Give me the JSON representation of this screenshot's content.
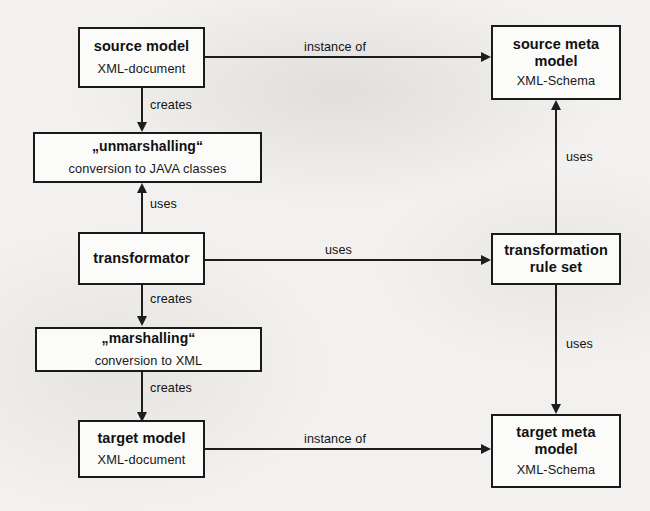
{
  "diagram": {
    "background_color": "#f2f1ef",
    "stroke_color": "#1d1d1d",
    "nodes": [
      {
        "id": "source_model",
        "title": "source model",
        "subtitle": "XML-document"
      },
      {
        "id": "source_meta_model",
        "title": "source meta",
        "title2": "model",
        "subtitle": "XML-Schema"
      },
      {
        "id": "unmarshalling",
        "title": "„unmarshalling“",
        "subtitle": "conversion to JAVA classes"
      },
      {
        "id": "transformator",
        "title": "transformator",
        "subtitle": ""
      },
      {
        "id": "transformation_rules",
        "title": "transformation",
        "title2": "rule set",
        "subtitle": ""
      },
      {
        "id": "marshalling",
        "title": "„marshalling“",
        "subtitle": "conversion to XML"
      },
      {
        "id": "target_model",
        "title": "target model",
        "subtitle": "XML-document"
      },
      {
        "id": "target_meta_model",
        "title": "target meta",
        "title2": "model",
        "subtitle": "XML-Schema"
      }
    ],
    "edges": [
      {
        "id": "e1",
        "from": "source_model",
        "to": "source_meta_model",
        "label": "instance of"
      },
      {
        "id": "e2",
        "from": "source_model",
        "to": "unmarshalling",
        "label": "creates"
      },
      {
        "id": "e3",
        "from": "transformator",
        "to": "unmarshalling",
        "label": "uses"
      },
      {
        "id": "e4",
        "from": "transformator",
        "to": "transformation_rules",
        "label": "uses"
      },
      {
        "id": "e5",
        "from": "transformation_rules",
        "to": "source_meta_model",
        "label": "uses"
      },
      {
        "id": "e6",
        "from": "transformation_rules",
        "to": "target_meta_model",
        "label": "uses"
      },
      {
        "id": "e7",
        "from": "transformator",
        "to": "marshalling",
        "label": "creates"
      },
      {
        "id": "e8",
        "from": "marshalling",
        "to": "target_model",
        "label": "creates"
      },
      {
        "id": "e9",
        "from": "target_model",
        "to": "target_meta_model",
        "label": "instance of"
      }
    ]
  }
}
